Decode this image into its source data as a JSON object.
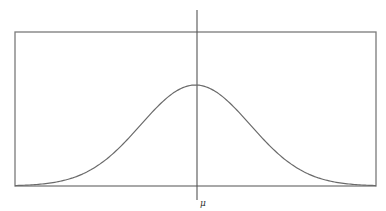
{
  "diagram": {
    "title": "",
    "type": "normal-distribution",
    "mean_label": "μ",
    "colors": {
      "frame": "#7a7a7a",
      "curve": "#6a6a6a",
      "mean_line": "#555555",
      "label": "#333333"
    }
  },
  "chart_data": {
    "type": "line",
    "title": "",
    "xlabel": "",
    "ylabel": "",
    "function": "normal_pdf",
    "mean": 0,
    "std_dev": 1,
    "xlim": [
      -3.3,
      3.3
    ],
    "ylim": [
      0,
      0.78
    ],
    "x_tick_labels": [
      "μ"
    ],
    "grid": false,
    "legend": "none",
    "annotations": [
      "vertical line at mean μ"
    ]
  }
}
